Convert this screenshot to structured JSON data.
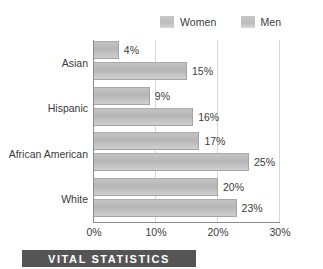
{
  "chart_data": {
    "type": "bar",
    "orientation": "horizontal",
    "title": "",
    "xlabel": "",
    "ylabel": "",
    "categories": [
      "Asian",
      "Hispanic",
      "African American",
      "White"
    ],
    "series": [
      {
        "name": "Women",
        "values": [
          4,
          9,
          17,
          20
        ],
        "value_labels": [
          "4%",
          "9%",
          "17%",
          "20%"
        ],
        "color": "#bdbdbd"
      },
      {
        "name": "Men",
        "values": [
          15,
          16,
          25,
          23
        ],
        "value_labels": [
          "15%",
          "16%",
          "25%",
          "23%"
        ],
        "color": "#bdbdbd"
      }
    ],
    "xlim": [
      0,
      30
    ],
    "xticks": [
      0,
      10,
      20,
      30
    ],
    "xtick_labels": [
      "0%",
      "10%",
      "20%",
      "30%"
    ],
    "grid": true,
    "legend_position": "top-right",
    "unit": "%"
  },
  "legend": {
    "entries": [
      {
        "label": "Women"
      },
      {
        "label": "Men"
      }
    ]
  },
  "footer": {
    "banner_text": "VITAL STATISTICS"
  },
  "colors": {
    "bar_fill": "#bdbdbd",
    "bar_edge": "#a4a4a4",
    "axis": "#8d8d8d",
    "gridline": "#d8d8d8",
    "text": "#3a3a3a",
    "banner_bg": "#555555",
    "banner_text": "#ffffff",
    "background": "#ffffff"
  }
}
